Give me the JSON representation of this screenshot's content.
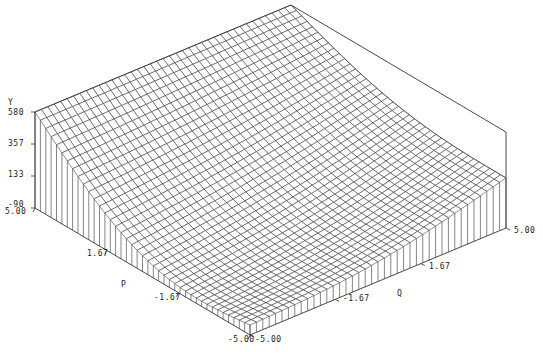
{
  "chart_data": {
    "type": "surface",
    "title": "",
    "xlabel": "P",
    "ylabel": "Q",
    "zlabel": "Y",
    "x_range": [
      -5.0,
      5.0
    ],
    "y_range": [
      -5.0,
      5.0
    ],
    "z_range": [
      -90,
      580
    ],
    "x_ticks": [
      "5.00",
      "1.67",
      "-1.67",
      "-5.00"
    ],
    "y_ticks": [
      "-5.00",
      "-1.67",
      "1.67",
      "5.00"
    ],
    "z_ticks": [
      "580",
      "357",
      "133",
      "-90"
    ],
    "grid_resolution": 40,
    "surface_description": "Wireframe surface with valley along the front/left, rising steeply toward the back corner (P=5, Q=5) and the left corner (P=5, Q=-5)",
    "corner_values": {
      "P=5,Q=5": 580,
      "P=5,Q=-5": 580,
      "P=-5,Q=5": 260,
      "P=-5,Q=-5": -20
    },
    "line_color": "#333333",
    "background": "#ffffff"
  },
  "labels": {
    "z_axis": "Y",
    "x_axis": "P",
    "y_axis": "Q",
    "z_580": "580",
    "z_357": "357",
    "z_133": "133",
    "z_m90": "-90",
    "p_500": "5.00",
    "p_167": "1.67",
    "p_m167": "-1.67",
    "p_m500": "-5.00",
    "q_m500": "-5.00",
    "q_m167": "-1.67",
    "q_167": "1.67",
    "q_500": "5.00"
  }
}
